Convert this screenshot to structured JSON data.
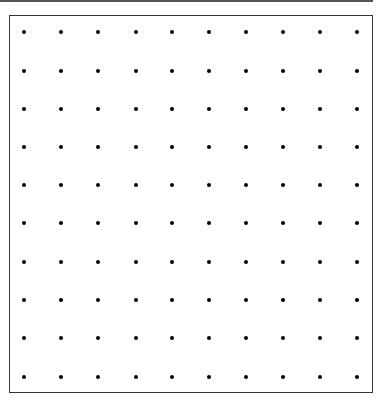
{
  "diagram": {
    "type": "dot-grid",
    "rows": 10,
    "cols": 10,
    "dot_color": "#000000",
    "frame_color": "#333333",
    "top_rule_color": "#555555",
    "dot_x": [
      24,
      61,
      98,
      136,
      172,
      209,
      246,
      283,
      320,
      357
    ],
    "dot_y": [
      32,
      71,
      109,
      147,
      185,
      223,
      262,
      300,
      338,
      377
    ]
  }
}
